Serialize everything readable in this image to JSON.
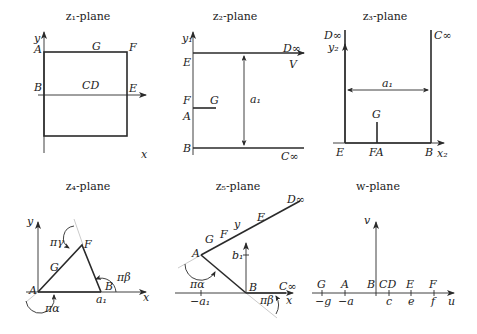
{
  "figure": {
    "panels": [
      {
        "id": "z1",
        "title": "z₁-plane",
        "axes": {
          "x": "x",
          "y": "y"
        },
        "labels": {
          "A": "A",
          "G": "G",
          "F": "F",
          "B": "B",
          "CD": "CD",
          "E": "E"
        }
      },
      {
        "id": "z2",
        "title": "z₂-plane",
        "axes": {
          "y": "y₁"
        },
        "labels": {
          "D": "D∞",
          "E": "E",
          "V": "V",
          "F": "F",
          "G": "G",
          "A": "A",
          "B": "B",
          "C": "C∞",
          "a1": "a₁"
        }
      },
      {
        "id": "z3",
        "title": "z₃-plane",
        "axes": {
          "x": "x₂",
          "y": "y₂"
        },
        "labels": {
          "D": "D∞",
          "C": "C∞",
          "a1": "a₁",
          "G": "G",
          "E": "E",
          "FA": "FA",
          "B": "B"
        }
      },
      {
        "id": "z4",
        "title": "z₄-plane",
        "axes": {
          "x": "x",
          "y": "y"
        },
        "labels": {
          "A": "A",
          "G": "G",
          "F": "F",
          "B": "B",
          "a1": "a₁",
          "pi_alpha": "πα",
          "pi_beta": "πβ",
          "pi_gamma": "πγ"
        }
      },
      {
        "id": "z5",
        "title": "z₅-plane",
        "axes": {
          "x": "x",
          "y": "y"
        },
        "labels": {
          "D": "D∞",
          "E": "E",
          "F": "F",
          "G": "G",
          "A": "A",
          "B": "B",
          "C": "C∞",
          "b1": "b₁",
          "neg_a1": "−a₁",
          "pi_alpha": "πα",
          "pi_beta": "πβ"
        }
      },
      {
        "id": "w",
        "title": "w-plane",
        "axes": {
          "x": "u",
          "y": "v"
        },
        "points": [
          {
            "name": "G",
            "tick": "−g"
          },
          {
            "name": "A",
            "tick": "−a"
          },
          {
            "name": "B",
            "tick": ""
          },
          {
            "name": "CD",
            "tick": "c"
          },
          {
            "name": "E",
            "tick": "e"
          },
          {
            "name": "F",
            "tick": "f"
          }
        ]
      }
    ]
  }
}
